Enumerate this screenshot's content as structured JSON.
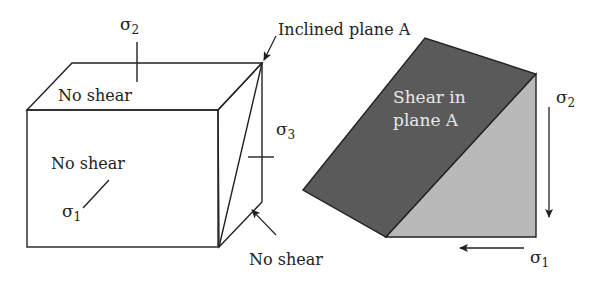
{
  "figure": {
    "left_block": {
      "top_face_label": "No shear",
      "front_face_label": "No shear",
      "side_face_label": "No shear",
      "sigma2_label": "σ",
      "sigma2_sub": "2",
      "sigma1_label": "σ",
      "sigma1_sub": "1",
      "sigma3_label": "σ",
      "sigma3_sub": "3",
      "inclined_plane_label": "Inclined plane A"
    },
    "right_wedge": {
      "plane_label_line1": "Shear in",
      "plane_label_line2": "plane A",
      "sigma2_label": "σ",
      "sigma2_sub": "2",
      "sigma1_label": "σ",
      "sigma1_sub": "1"
    },
    "colors": {
      "outline": "#222222",
      "side_face_fill": "#b4b4b4",
      "inclined_plane_fill": "#5a5a5a",
      "wedge_side_fill": "#b9b9b9",
      "background": "#ffffff"
    }
  }
}
